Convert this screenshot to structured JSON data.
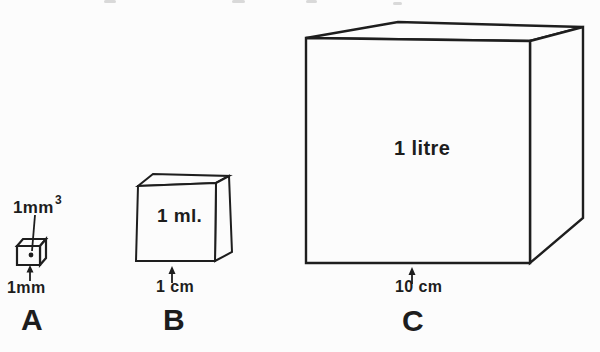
{
  "diagram": {
    "ink_color": "#1e1e1e",
    "paper_color": "#fcfcfc",
    "cubes": {
      "a": {
        "letter": "A",
        "volume_value": "1mm",
        "volume_sup": "3",
        "size_label": "1mm"
      },
      "b": {
        "letter": "B",
        "volume_label": "1 ml.",
        "size_label": "1 cm"
      },
      "c": {
        "letter": "C",
        "volume_label": "1 litre",
        "size_label": "10 cm"
      }
    }
  }
}
